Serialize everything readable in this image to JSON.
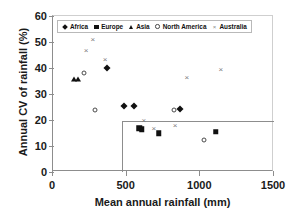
{
  "chart_data": {
    "type": "scatter",
    "title": "",
    "xlabel": "Mean annual rainfall (mm)",
    "ylabel": "Annual CV of rainfall (%)",
    "xlim": [
      0,
      1500
    ],
    "ylim": [
      0,
      60
    ],
    "xticks": [
      0,
      500,
      1000,
      1500
    ],
    "yticks": [
      0,
      10,
      20,
      30,
      40,
      50,
      60
    ],
    "grid": false,
    "legend_position": "top-left-inside",
    "annotations": [
      {
        "kind": "reference-rectangle",
        "x_from": 470,
        "x_to": 1500,
        "y_from": 0,
        "y_to": 19.5,
        "color": "#8d8d8d"
      }
    ],
    "series": [
      {
        "name": "Africa",
        "marker": "filled-diamond",
        "color": "#111111",
        "points": [
          {
            "x": 366,
            "y": 40.0
          },
          {
            "x": 482,
            "y": 25.4
          },
          {
            "x": 550,
            "y": 25.4
          },
          {
            "x": 862,
            "y": 24.2
          }
        ]
      },
      {
        "name": "Europe",
        "marker": "filled-square",
        "color": "#111111",
        "points": [
          {
            "x": 584,
            "y": 16.9
          },
          {
            "x": 604,
            "y": 16.5
          },
          {
            "x": 719,
            "y": 15.0
          },
          {
            "x": 1106,
            "y": 15.4
          }
        ]
      },
      {
        "name": "Asia",
        "marker": "filled-triangle",
        "color": "#111111",
        "points": [
          {
            "x": 142,
            "y": 35.8
          },
          {
            "x": 170,
            "y": 35.8
          }
        ]
      },
      {
        "name": "North America",
        "marker": "open-circle",
        "color": "#4a4a4a",
        "points": [
          {
            "x": 210,
            "y": 38.1
          },
          {
            "x": 285,
            "y": 23.8
          },
          {
            "x": 821,
            "y": 23.8
          },
          {
            "x": 1024,
            "y": 12.3
          }
        ]
      },
      {
        "name": "Australia",
        "marker": "cross",
        "color": "#7d7d7d",
        "points": [
          {
            "x": 224,
            "y": 46.9
          },
          {
            "x": 271,
            "y": 51.2
          },
          {
            "x": 353,
            "y": 43.5
          },
          {
            "x": 617,
            "y": 20.0
          },
          {
            "x": 685,
            "y": 16.9
          },
          {
            "x": 828,
            "y": 18.1
          },
          {
            "x": 909,
            "y": 36.5
          },
          {
            "x": 1140,
            "y": 39.6
          }
        ]
      }
    ]
  }
}
